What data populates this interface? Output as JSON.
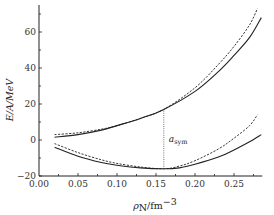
{
  "chart_data": {
    "type": "line",
    "title": "",
    "xlabel": "ρN/fm^-3",
    "ylabel": "E/A/MeV",
    "xlim": [
      0.0,
      0.285
    ],
    "ylim": [
      -20,
      75
    ],
    "grid": false,
    "legend": null,
    "x_ticks": [
      "0.00",
      "0.05",
      "0.10",
      "0.15",
      "0.20",
      "0.25"
    ],
    "y_ticks": [
      "-20",
      "0",
      "20",
      "40",
      "60"
    ],
    "series": [
      {
        "name": "upper-solid",
        "style": "solid",
        "x": [
          0.02,
          0.05,
          0.08,
          0.1,
          0.13,
          0.16,
          0.2,
          0.23,
          0.25,
          0.27,
          0.285
        ],
        "y": [
          1.5,
          3,
          5.5,
          8,
          12,
          17,
          27,
          38,
          47,
          57,
          68
        ]
      },
      {
        "name": "upper-dashed",
        "style": "dashed",
        "x": [
          0.02,
          0.05,
          0.08,
          0.1,
          0.13,
          0.16,
          0.2,
          0.23,
          0.25,
          0.27,
          0.28
        ],
        "y": [
          3,
          4,
          6,
          8,
          12,
          17,
          29,
          42,
          52,
          64,
          73
        ]
      },
      {
        "name": "lower-solid",
        "style": "solid",
        "x": [
          0.02,
          0.05,
          0.08,
          0.1,
          0.13,
          0.16,
          0.18,
          0.2,
          0.23,
          0.25,
          0.27,
          0.285
        ],
        "y": [
          -4,
          -9,
          -12.5,
          -14,
          -15.5,
          -16,
          -15.5,
          -13.5,
          -9.5,
          -5.5,
          -1,
          3
        ]
      },
      {
        "name": "lower-dashed",
        "style": "dashed",
        "x": [
          0.02,
          0.05,
          0.08,
          0.1,
          0.13,
          0.16,
          0.18,
          0.2,
          0.23,
          0.25,
          0.27,
          0.28
        ],
        "y": [
          -2,
          -7,
          -11,
          -13,
          -15,
          -16,
          -14.5,
          -11.5,
          -5,
          1,
          8,
          14
        ]
      }
    ],
    "annotations": [
      {
        "text": "a_sym",
        "label_main": "a",
        "label_sub": "sym",
        "x": 0.16,
        "y_from": -16,
        "y_to": 17,
        "style": "dotted-vertical"
      }
    ]
  },
  "axes": {
    "xlabel_main": "ρ",
    "xlabel_sub": "N",
    "xlabel_unit": "/fm",
    "xlabel_exp": "−3",
    "ylabel": "E/A/MeV"
  },
  "colors": {
    "line": "#222222",
    "axis": "#222222",
    "dotted": "#555555"
  }
}
